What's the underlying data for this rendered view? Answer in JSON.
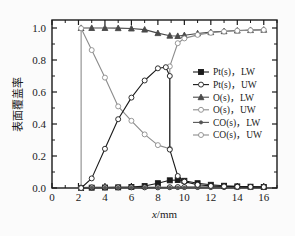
{
  "chart_data": {
    "type": "line",
    "title": "",
    "xlabel": "x/mm",
    "ylabel": "表面覆盖率",
    "xlim": [
      0,
      17
    ],
    "ylim": [
      0,
      1.05
    ],
    "xticks": [
      0,
      2,
      4,
      6,
      8,
      10,
      12,
      14,
      16
    ],
    "xticklabels": [
      "0",
      "2",
      "4",
      "6",
      "8",
      "10",
      "12",
      "14",
      "16"
    ],
    "yticks": [
      0.0,
      0.2,
      0.4,
      0.6,
      0.8,
      1.0
    ],
    "yticklabels": [
      "0.0",
      "0.2",
      "0.4",
      "0.6",
      "0.8",
      "1.0"
    ],
    "grid": false,
    "legend_position": "right-center",
    "series": [
      {
        "name": "Pt(s)，LW",
        "marker": "filled-square",
        "color": "#1a1a1a",
        "fill": "#1a1a1a",
        "x": [
          2.2,
          3,
          4,
          5,
          6,
          7,
          8,
          8.9,
          9.5,
          10,
          11,
          12,
          13,
          14,
          15,
          16
        ],
        "y": [
          0.0,
          0.002,
          0.003,
          0.004,
          0.006,
          0.012,
          0.03,
          0.048,
          0.05,
          0.045,
          0.03,
          0.02,
          0.014,
          0.01,
          0.008,
          0.006
        ]
      },
      {
        "name": "Pt(s)，UW",
        "marker": "open-circle",
        "color": "#1a1a1a",
        "fill": "#ffffff",
        "x": [
          2.2,
          3,
          4,
          5,
          6,
          7,
          8,
          8.9,
          9.5,
          10,
          11,
          12,
          13,
          14,
          15,
          16
        ],
        "y": [
          0.003,
          0.004,
          0.004,
          0.004,
          0.004,
          0.004,
          0.004,
          0.005,
          0.006,
          0.006,
          0.006,
          0.006,
          0.006,
          0.006,
          0.006,
          0.006
        ]
      },
      {
        "name": "O(s)，LW",
        "marker": "filled-triangle",
        "color": "#4a4a4a",
        "fill": "#4a4a4a",
        "x": [
          2.2,
          3,
          4,
          5,
          6,
          7,
          8,
          8.9,
          9.5,
          10,
          11,
          12,
          13,
          14,
          15,
          16
        ],
        "y": [
          1.0,
          1.0,
          1.0,
          0.999,
          0.997,
          0.99,
          0.968,
          0.952,
          0.95,
          0.955,
          0.966,
          0.974,
          0.98,
          0.984,
          0.987,
          0.989
        ]
      },
      {
        "name": "O(s)，UW",
        "marker": "open-circle",
        "color": "#8c8c8c",
        "fill": "#ffffff",
        "x": [
          2.2,
          2.2,
          3,
          4,
          5,
          6,
          7,
          8,
          8.9,
          8.9,
          9.5,
          10,
          11,
          12,
          13,
          14,
          15,
          16
        ],
        "y": [
          0.0,
          0.998,
          0.862,
          0.69,
          0.51,
          0.42,
          0.335,
          0.268,
          0.245,
          0.76,
          0.905,
          0.935,
          0.957,
          0.97,
          0.978,
          0.983,
          0.986,
          0.988
        ]
      },
      {
        "name": "CO(s)，LW",
        "marker": "filled-star",
        "color": "#555555",
        "fill": "#555555",
        "x": [
          2.2,
          3,
          4,
          5,
          6,
          7,
          8,
          8.9,
          9.5,
          10,
          11,
          12,
          13,
          14,
          15,
          16
        ],
        "y": [
          0.002,
          0.002,
          0.002,
          0.002,
          0.002,
          0.002,
          0.002,
          0.002,
          0.002,
          0.002,
          0.002,
          0.002,
          0.002,
          0.002,
          0.002,
          0.002
        ]
      },
      {
        "name": "CO(s)，UW",
        "marker": "open-circle",
        "color": "#1a1a1a",
        "fill": "#ffffff",
        "x": [
          2.2,
          3,
          4,
          5,
          6,
          7,
          8,
          8.6,
          8.9,
          8.9,
          9.5,
          10,
          11,
          12,
          13,
          14,
          15,
          16
        ],
        "y": [
          0.0,
          0.06,
          0.245,
          0.43,
          0.565,
          0.672,
          0.748,
          0.755,
          0.7,
          0.24,
          0.075,
          0.04,
          0.02,
          0.013,
          0.01,
          0.008,
          0.007,
          0.006
        ]
      }
    ],
    "legend_entries": [
      {
        "label": "Pt(s)，LW",
        "marker": "filled-square",
        "color": "#1a1a1a",
        "fill": "#1a1a1a"
      },
      {
        "label": "Pt(s)，UW",
        "marker": "open-circle",
        "color": "#1a1a1a",
        "fill": "#ffffff"
      },
      {
        "label": "O(s)，LW",
        "marker": "filled-triangle",
        "color": "#4a4a4a",
        "fill": "#4a4a4a"
      },
      {
        "label": "O(s)，UW",
        "marker": "open-circle",
        "color": "#8c8c8c",
        "fill": "#ffffff"
      },
      {
        "label": "CO(s)，LW",
        "marker": "filled-star",
        "color": "#555555",
        "fill": "#555555"
      },
      {
        "label": "CO(s)，UW",
        "marker": "open-circle",
        "color": "#8c8c8c",
        "fill": "#ffffff"
      }
    ],
    "colors": {
      "axis": "#1a1a1a",
      "background": "#fbfbfb",
      "plot_background": "#ffffff",
      "text": "#1a1a1a"
    }
  }
}
